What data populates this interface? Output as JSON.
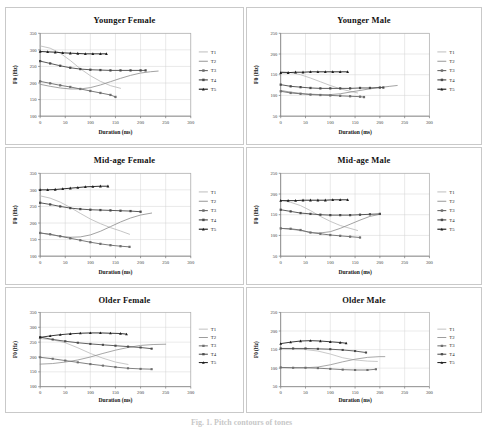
{
  "figure": {
    "caption": "Fig. 1.  Pitch contours of tones",
    "axis": {
      "x_label": "Duration (ms)",
      "y_label": "F0 (Hz)"
    },
    "legend": [
      "T1",
      "T2",
      "T3",
      "T4",
      "T5"
    ],
    "series_style": {
      "T1": {
        "color": "#b8b8b8",
        "marker": "none"
      },
      "T2": {
        "color": "#8d8d8d",
        "marker": "none"
      },
      "T3": {
        "color": "#6e6e6e",
        "marker": "square"
      },
      "T4": {
        "color": "#4a4a4a",
        "marker": "square"
      },
      "T5": {
        "color": "#1c1c1c",
        "marker": "triangle"
      }
    }
  },
  "chart_data": [
    {
      "type": "line",
      "title": "Younger Female",
      "xlabel": "Duration (ms)",
      "ylabel": "F0 (Hz)",
      "xlim": [
        0,
        300
      ],
      "ylim": [
        100,
        350
      ],
      "xticks": [
        0,
        50,
        100,
        150,
        200,
        250,
        300
      ],
      "yticks": [
        100,
        150,
        200,
        250,
        300,
        350
      ],
      "grid": true,
      "legend_position": "right",
      "series": [
        {
          "name": "T1",
          "x": [
            0,
            20,
            40,
            60,
            80,
            100,
            120,
            140,
            160
          ],
          "y": [
            312,
            305,
            290,
            268,
            243,
            222,
            205,
            192,
            184
          ]
        },
        {
          "name": "T2",
          "x": [
            0,
            20,
            40,
            60,
            80,
            100,
            120,
            140,
            160,
            180,
            200,
            220,
            235
          ],
          "y": [
            196,
            190,
            185,
            182,
            182,
            186,
            194,
            204,
            214,
            223,
            230,
            234,
            236
          ]
        },
        {
          "name": "T3",
          "x": [
            0,
            20,
            40,
            60,
            80,
            100,
            120,
            140,
            150
          ],
          "y": [
            205,
            199,
            193,
            188,
            182,
            176,
            170,
            164,
            158
          ]
        },
        {
          "name": "T4",
          "x": [
            0,
            20,
            40,
            60,
            80,
            100,
            120,
            140,
            160,
            180,
            200,
            210
          ],
          "y": [
            266,
            259,
            252,
            246,
            242,
            240,
            239,
            238,
            238,
            238,
            238,
            238
          ]
        },
        {
          "name": "T5",
          "x": [
            0,
            15,
            30,
            45,
            60,
            75,
            90,
            105,
            120,
            132
          ],
          "y": [
            295,
            294,
            293,
            291,
            290,
            289,
            288,
            288,
            288,
            288
          ]
        }
      ]
    },
    {
      "type": "line",
      "title": "Younger Male",
      "xlabel": "Duration (ms)",
      "ylabel": "F0 (Hz)",
      "xlim": [
        0,
        300
      ],
      "ylim": [
        50,
        250
      ],
      "xticks": [
        0,
        50,
        100,
        150,
        200,
        250,
        300
      ],
      "yticks": [
        50,
        100,
        150,
        200,
        250
      ],
      "grid": true,
      "legend_position": "right",
      "series": [
        {
          "name": "T1",
          "x": [
            0,
            20,
            40,
            60,
            80,
            100,
            120,
            140,
            155
          ],
          "y": [
            158,
            155,
            150,
            142,
            133,
            124,
            116,
            110,
            106
          ]
        },
        {
          "name": "T2",
          "x": [
            0,
            20,
            40,
            60,
            80,
            100,
            120,
            140,
            160,
            180,
            200,
            220,
            235
          ],
          "y": [
            112,
            108,
            105,
            103,
            102,
            102,
            104,
            108,
            112,
            116,
            119,
            122,
            124
          ]
        },
        {
          "name": "T3",
          "x": [
            0,
            20,
            40,
            60,
            80,
            100,
            120,
            140,
            160,
            168
          ],
          "y": [
            110,
            106,
            104,
            102,
            101,
            100,
            99,
            98,
            97,
            96
          ]
        },
        {
          "name": "T4",
          "x": [
            0,
            20,
            40,
            60,
            80,
            100,
            120,
            140,
            160,
            180,
            200,
            207
          ],
          "y": [
            126,
            122,
            120,
            118,
            117,
            117,
            117,
            117,
            118,
            118,
            119,
            119
          ]
        },
        {
          "name": "T5",
          "x": [
            0,
            15,
            30,
            45,
            60,
            75,
            90,
            105,
            120,
            135
          ],
          "y": [
            155,
            155,
            156,
            156,
            157,
            157,
            157,
            157,
            157,
            157
          ]
        }
      ]
    },
    {
      "type": "line",
      "title": "Mid-age Female",
      "xlabel": "Duration (ms)",
      "ylabel": "F0 (Hz)",
      "xlim": [
        0,
        300
      ],
      "ylim": [
        100,
        350
      ],
      "xticks": [
        0,
        50,
        100,
        150,
        200,
        250,
        300
      ],
      "yticks": [
        100,
        150,
        200,
        250,
        300,
        350
      ],
      "grid": true,
      "legend_position": "right",
      "series": [
        {
          "name": "T1",
          "x": [
            0,
            20,
            40,
            60,
            80,
            100,
            120,
            140,
            160,
            178
          ],
          "y": [
            282,
            275,
            263,
            247,
            229,
            212,
            198,
            186,
            176,
            166
          ]
        },
        {
          "name": "T2",
          "x": [
            0,
            20,
            40,
            60,
            80,
            100,
            120,
            140,
            160,
            180,
            200,
            222
          ],
          "y": [
            170,
            165,
            160,
            157,
            158,
            164,
            175,
            189,
            203,
            215,
            224,
            230
          ]
        },
        {
          "name": "T3",
          "x": [
            0,
            20,
            40,
            60,
            80,
            100,
            120,
            140,
            160,
            178
          ],
          "y": [
            170,
            166,
            160,
            154,
            148,
            142,
            137,
            133,
            130,
            128
          ]
        },
        {
          "name": "T4",
          "x": [
            0,
            20,
            40,
            60,
            80,
            100,
            120,
            140,
            160,
            180,
            200
          ],
          "y": [
            261,
            256,
            250,
            245,
            242,
            240,
            239,
            238,
            237,
            236,
            234
          ]
        },
        {
          "name": "T5",
          "x": [
            0,
            15,
            30,
            45,
            60,
            75,
            90,
            105,
            120,
            135
          ],
          "y": [
            300,
            300,
            301,
            303,
            305,
            307,
            309,
            310,
            311,
            311
          ]
        }
      ]
    },
    {
      "type": "line",
      "title": "Mid-age Male",
      "xlabel": "Duration (ms)",
      "ylabel": "F0 (Hz)",
      "xlim": [
        0,
        300
      ],
      "ylim": [
        50,
        250
      ],
      "xticks": [
        0,
        50,
        100,
        150,
        200,
        250,
        300
      ],
      "yticks": [
        50,
        100,
        150,
        200,
        250
      ],
      "grid": true,
      "legend_position": "right",
      "series": [
        {
          "name": "T1",
          "x": [
            0,
            20,
            40,
            60,
            80,
            100,
            120,
            140,
            155
          ],
          "y": [
            185,
            180,
            172,
            160,
            146,
            134,
            124,
            117,
            112
          ]
        },
        {
          "name": "T2",
          "x": [
            0,
            20,
            40,
            60,
            80,
            100,
            120,
            140,
            160,
            180,
            200
          ],
          "y": [
            117,
            115,
            112,
            107,
            106,
            109,
            117,
            127,
            137,
            146,
            151
          ]
        },
        {
          "name": "T3",
          "x": [
            0,
            20,
            40,
            60,
            80,
            100,
            120,
            140,
            160
          ],
          "y": [
            117,
            116,
            113,
            107,
            104,
            101,
            99,
            97,
            95
          ]
        },
        {
          "name": "T4",
          "x": [
            0,
            20,
            40,
            60,
            80,
            100,
            120,
            140,
            160,
            180,
            200
          ],
          "y": [
            162,
            158,
            154,
            152,
            150,
            149,
            149,
            149,
            150,
            151,
            152
          ]
        },
        {
          "name": "T5",
          "x": [
            0,
            15,
            30,
            45,
            60,
            75,
            90,
            105,
            120,
            135
          ],
          "y": [
            184,
            184,
            184,
            185,
            185,
            185,
            185,
            186,
            186,
            186
          ]
        }
      ]
    },
    {
      "type": "line",
      "title": "Older Female",
      "xlabel": "Duration (ms)",
      "ylabel": "F0 (Hz)",
      "xlim": [
        0,
        300
      ],
      "ylim": [
        100,
        350
      ],
      "xticks": [
        0,
        50,
        100,
        150,
        200,
        250,
        300
      ],
      "yticks": [
        100,
        150,
        200,
        250,
        300,
        350
      ],
      "grid": true,
      "legend_position": "right",
      "series": [
        {
          "name": "T1",
          "x": [
            0,
            25,
            50,
            75,
            100,
            125,
            150,
            175
          ],
          "y": [
            262,
            258,
            248,
            231,
            212,
            196,
            183,
            175
          ]
        },
        {
          "name": "T2",
          "x": [
            0,
            25,
            50,
            75,
            100,
            125,
            150,
            175,
            200,
            225,
            250
          ],
          "y": [
            176,
            178,
            183,
            190,
            200,
            212,
            223,
            232,
            239,
            242,
            243
          ]
        },
        {
          "name": "T3",
          "x": [
            0,
            25,
            50,
            75,
            100,
            125,
            150,
            175,
            200,
            222
          ],
          "y": [
            199,
            194,
            188,
            182,
            176,
            171,
            166,
            162,
            160,
            159
          ]
        },
        {
          "name": "T4",
          "x": [
            0,
            25,
            50,
            75,
            100,
            125,
            150,
            175,
            200,
            222
          ],
          "y": [
            267,
            259,
            253,
            248,
            244,
            241,
            238,
            235,
            232,
            228
          ]
        },
        {
          "name": "T5",
          "x": [
            0,
            20,
            40,
            60,
            80,
            100,
            120,
            140,
            160,
            172
          ],
          "y": [
            266,
            271,
            275,
            278,
            280,
            281,
            281,
            280,
            279,
            277
          ]
        }
      ]
    },
    {
      "type": "line",
      "title": "Older Male",
      "xlabel": "Duration (ms)",
      "ylabel": "F0 (Hz)",
      "xlim": [
        0,
        300
      ],
      "ylim": [
        50,
        250
      ],
      "xticks": [
        0,
        50,
        100,
        150,
        200,
        250,
        300
      ],
      "yticks": [
        50,
        100,
        150,
        200,
        250
      ],
      "grid": true,
      "legend_position": "right",
      "series": [
        {
          "name": "T1",
          "x": [
            0,
            25,
            50,
            75,
            100,
            125,
            150,
            175,
            195
          ],
          "y": [
            152,
            151,
            150,
            146,
            138,
            128,
            122,
            119,
            118
          ]
        },
        {
          "name": "T2",
          "x": [
            0,
            25,
            50,
            75,
            100,
            125,
            150,
            175,
            200,
            210
          ],
          "y": [
            101,
            101,
            101,
            103,
            109,
            117,
            124,
            129,
            131,
            131
          ]
        },
        {
          "name": "T3",
          "x": [
            0,
            25,
            50,
            75,
            100,
            125,
            150,
            175,
            192
          ],
          "y": [
            102,
            101,
            101,
            100,
            98,
            96,
            95,
            95,
            97
          ]
        },
        {
          "name": "T4",
          "x": [
            0,
            25,
            50,
            75,
            100,
            125,
            150,
            172
          ],
          "y": [
            153,
            153,
            153,
            152,
            151,
            149,
            146,
            142
          ]
        },
        {
          "name": "T5",
          "x": [
            0,
            20,
            40,
            60,
            80,
            100,
            120,
            132
          ],
          "y": [
            166,
            170,
            173,
            174,
            173,
            171,
            169,
            167
          ]
        }
      ]
    }
  ]
}
